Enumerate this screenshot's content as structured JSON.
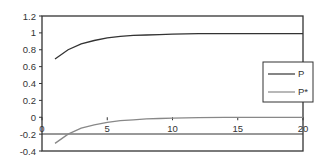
{
  "chart_data": {
    "type": "line",
    "title": "",
    "xlabel": "",
    "ylabel": "",
    "xlim": [
      0,
      20
    ],
    "ylim": [
      -0.4,
      1.2
    ],
    "x_ticks": [
      "0",
      "5",
      "10",
      "15",
      "20"
    ],
    "y_ticks": [
      "1.2",
      "1",
      "0.8",
      "0.6",
      "0.4",
      "0.2",
      "0",
      "-0.2",
      "-0.4"
    ],
    "grid": false,
    "legend_position": "right",
    "x": [
      1,
      2,
      3,
      4,
      5,
      6,
      7,
      8,
      9,
      10,
      12,
      14,
      16,
      18,
      20
    ],
    "series": [
      {
        "name": "P",
        "color": "#333333",
        "values": [
          0.69,
          0.8,
          0.87,
          0.91,
          0.94,
          0.96,
          0.97,
          0.975,
          0.98,
          0.985,
          0.99,
          0.99,
          0.99,
          0.99,
          0.99
        ]
      },
      {
        "name": "P*",
        "color": "#888888",
        "values": [
          -0.31,
          -0.2,
          -0.13,
          -0.09,
          -0.06,
          -0.04,
          -0.03,
          -0.02,
          -0.015,
          -0.01,
          -0.005,
          0,
          0,
          0,
          0
        ]
      }
    ]
  },
  "legend": {
    "items": [
      {
        "label": "P"
      },
      {
        "label": "P*"
      }
    ]
  }
}
